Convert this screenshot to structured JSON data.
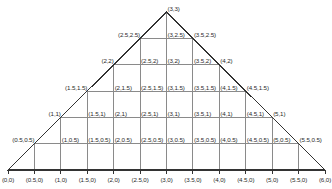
{
  "figure": {
    "shape": "triangle",
    "stroke_outline": "#333333",
    "stroke_grid": "#8a8a8a",
    "background": "#ffffff",
    "text_color": "#2b2b2b"
  },
  "geometry": {
    "apex": [
      3,
      3
    ],
    "base_left": [
      0,
      0
    ],
    "base_right": [
      6,
      0
    ],
    "grid_step": 0.5,
    "x_min": 0,
    "x_max": 6,
    "y_min": 0,
    "y_max": 3,
    "px_left": 8,
    "px_right": 325,
    "px_bottom": 170,
    "px_top": 12
  },
  "axis_labels": [
    {
      "text": "(0,0)",
      "x": 0
    },
    {
      "text": "(0.5,0)",
      "x": 0.5
    },
    {
      "text": "(1,0)",
      "x": 1
    },
    {
      "text": "(1.5,0)",
      "x": 1.5
    },
    {
      "text": "(2,0)",
      "x": 2
    },
    {
      "text": "(2.5,0)",
      "x": 2.5
    },
    {
      "text": "(3,0)",
      "x": 3
    },
    {
      "text": "(3.5,0)",
      "x": 3.5
    },
    {
      "text": "(4,0)",
      "x": 4
    },
    {
      "text": "(4.5,0)",
      "x": 4.5
    },
    {
      "text": "(5,0)",
      "x": 5
    },
    {
      "text": "(5.5,0)",
      "x": 5.5
    },
    {
      "text": "(6,0)",
      "x": 6
    }
  ],
  "node_labels": [
    {
      "text": "(0.5,0.5)",
      "x": 0.5,
      "y": 0.5,
      "anchor": "right"
    },
    {
      "text": "(1,0.5)",
      "x": 1,
      "y": 0.5,
      "anchor": "left"
    },
    {
      "text": "(1.5,0.5)",
      "x": 1.5,
      "y": 0.5,
      "anchor": "left"
    },
    {
      "text": "(2,0.5)",
      "x": 2,
      "y": 0.5,
      "anchor": "left"
    },
    {
      "text": "(2.5,0.5)",
      "x": 2.5,
      "y": 0.5,
      "anchor": "left"
    },
    {
      "text": "(3,0.5)",
      "x": 3,
      "y": 0.5,
      "anchor": "left"
    },
    {
      "text": "(3.5,0.5)",
      "x": 3.5,
      "y": 0.5,
      "anchor": "left"
    },
    {
      "text": "(4,0.5)",
      "x": 4,
      "y": 0.5,
      "anchor": "left"
    },
    {
      "text": "(4.5,0.5)",
      "x": 4.5,
      "y": 0.5,
      "anchor": "left"
    },
    {
      "text": "(5,0.5)",
      "x": 5,
      "y": 0.5,
      "anchor": "left"
    },
    {
      "text": "(5.5,0.5)",
      "x": 5.5,
      "y": 0.5,
      "anchor": "left"
    },
    {
      "text": "(1,1)",
      "x": 1,
      "y": 1,
      "anchor": "right"
    },
    {
      "text": "(1.5,1)",
      "x": 1.5,
      "y": 1,
      "anchor": "left"
    },
    {
      "text": "(2,1)",
      "x": 2,
      "y": 1,
      "anchor": "left"
    },
    {
      "text": "(2.5,1)",
      "x": 2.5,
      "y": 1,
      "anchor": "left"
    },
    {
      "text": "(3,1)",
      "x": 3,
      "y": 1,
      "anchor": "left"
    },
    {
      "text": "(3.5,1)",
      "x": 3.5,
      "y": 1,
      "anchor": "left"
    },
    {
      "text": "(4,1)",
      "x": 4,
      "y": 1,
      "anchor": "left"
    },
    {
      "text": "(4.5,1)",
      "x": 4.5,
      "y": 1,
      "anchor": "left"
    },
    {
      "text": "(5,1)",
      "x": 5,
      "y": 1,
      "anchor": "left"
    },
    {
      "text": "(1.5,1.5)",
      "x": 1.5,
      "y": 1.5,
      "anchor": "right"
    },
    {
      "text": "(2,1.5)",
      "x": 2,
      "y": 1.5,
      "anchor": "left"
    },
    {
      "text": "(2.5,1.5)",
      "x": 2.5,
      "y": 1.5,
      "anchor": "left"
    },
    {
      "text": "(3,1.5)",
      "x": 3,
      "y": 1.5,
      "anchor": "left"
    },
    {
      "text": "(3.5,1.5)",
      "x": 3.5,
      "y": 1.5,
      "anchor": "left"
    },
    {
      "text": "(4,1.5)",
      "x": 4,
      "y": 1.5,
      "anchor": "left"
    },
    {
      "text": "(4.5,1.5)",
      "x": 4.5,
      "y": 1.5,
      "anchor": "left"
    },
    {
      "text": "(2,2)",
      "x": 2,
      "y": 2,
      "anchor": "right"
    },
    {
      "text": "(2.5,2)",
      "x": 2.5,
      "y": 2,
      "anchor": "left"
    },
    {
      "text": "(3,2)",
      "x": 3,
      "y": 2,
      "anchor": "left"
    },
    {
      "text": "(3.5,2)",
      "x": 3.5,
      "y": 2,
      "anchor": "left"
    },
    {
      "text": "(4,2)",
      "x": 4,
      "y": 2,
      "anchor": "left"
    },
    {
      "text": "(2.5,2.5)",
      "x": 2.5,
      "y": 2.5,
      "anchor": "right"
    },
    {
      "text": "(3,2.5)",
      "x": 3,
      "y": 2.5,
      "anchor": "left"
    },
    {
      "text": "(3.5,2.5)",
      "x": 3.5,
      "y": 2.5,
      "anchor": "left"
    },
    {
      "text": "(3,3)",
      "x": 3,
      "y": 3,
      "anchor": "left"
    }
  ],
  "grid_lines": {
    "horizontal_y": [
      0.5,
      1,
      1.5,
      2,
      2.5
    ],
    "vertical_x": [
      0.5,
      1,
      1.5,
      2,
      2.5,
      3,
      3.5,
      4,
      4.5,
      5,
      5.5
    ]
  }
}
